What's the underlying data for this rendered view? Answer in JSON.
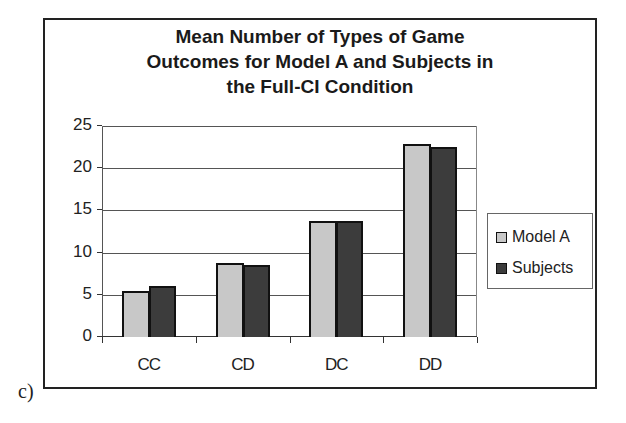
{
  "chart_data": {
    "type": "bar",
    "title": "Mean Number of Types of Game Outcomes for Model A and Subjects in the Full-CI Condition",
    "title_lines": [
      "Mean Number of Types of Game",
      "Outcomes for Model A and Subjects in",
      "the Full-CI Condition"
    ],
    "categories": [
      "CC",
      "CD",
      "DC",
      "DD"
    ],
    "series": [
      {
        "name": "Model A",
        "color": "#c8c8c8",
        "values": [
          5.4,
          8.8,
          13.7,
          22.9
        ]
      },
      {
        "name": "Subjects",
        "color": "#3c3c3c",
        "values": [
          6.1,
          8.5,
          13.7,
          22.5
        ]
      }
    ],
    "xlabel": "",
    "ylabel": "",
    "ylim": [
      0,
      25
    ],
    "yticks": [
      "0",
      "5",
      "10",
      "15",
      "20",
      "25"
    ],
    "grid": true,
    "legend_position": "right"
  },
  "caption": "c)"
}
